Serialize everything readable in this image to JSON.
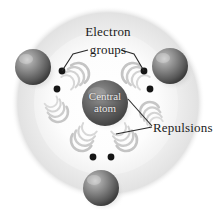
{
  "figure": {
    "background_color": "#ffffff",
    "width": 216,
    "height": 210
  },
  "labels": {
    "electron": "Electron",
    "groups": "groups",
    "repulsions": "Repulsions",
    "central_line1": "Central",
    "central_line2": "atom"
  },
  "colors": {
    "text": "#1b1b1b",
    "central_text": "#eceaea",
    "sphere_dark": "#3f3f3f",
    "sphere_mid": "#767676",
    "sphere_light": "#b9b9b9",
    "halo": "#e9e9e9",
    "dot": "#161616",
    "leader": "#2a2a2a",
    "arc": "#c9c9c9"
  },
  "diagram": {
    "halo": {
      "cx": 108,
      "cy": 103,
      "r": 97
    },
    "central_atom": {
      "cx": 105,
      "cy": 103,
      "r": 23,
      "label": "Central atom"
    },
    "outer_spheres": [
      {
        "name": "sphere-left",
        "cx": 33,
        "cy": 67,
        "r": 18
      },
      {
        "name": "sphere-right",
        "cx": 170,
        "cy": 66,
        "r": 18
      },
      {
        "name": "sphere-bottom",
        "cx": 101,
        "cy": 188,
        "r": 18
      }
    ],
    "electron_dots": [
      {
        "name": "dot-upper-left",
        "cx": 62,
        "cy": 71
      },
      {
        "name": "dot-mid-left",
        "cx": 57,
        "cy": 89
      },
      {
        "name": "dot-upper-right",
        "cx": 144,
        "cy": 71
      },
      {
        "name": "dot-mid-right",
        "cx": 150,
        "cy": 89
      },
      {
        "name": "dot-bottom-left",
        "cx": 93,
        "cy": 157
      },
      {
        "name": "dot-bottom-right",
        "cx": 111,
        "cy": 157
      }
    ],
    "repulsion_arc_groups": [
      {
        "name": "arc-top-left",
        "cx": 78,
        "cy": 74,
        "rotate": -35
      },
      {
        "name": "arc-top-right",
        "cx": 131,
        "cy": 74,
        "rotate": 215
      },
      {
        "name": "arc-left",
        "cx": 56,
        "cy": 112,
        "rotate": 60
      },
      {
        "name": "arc-bottom-left",
        "cx": 80,
        "cy": 140,
        "rotate": 125
      },
      {
        "name": "arc-bottom-right",
        "cx": 126,
        "cy": 140,
        "rotate": 55
      },
      {
        "name": "arc-right",
        "cx": 150,
        "cy": 112,
        "rotate": 240
      }
    ],
    "leader_lines": [
      {
        "name": "leader-electron-groups-left",
        "points": "62,71 73,54 89,50"
      },
      {
        "name": "leader-electron-groups-right",
        "points": "144,71 134,54 122,50"
      },
      {
        "name": "leader-repulsions-upper",
        "points": "128,99 152,126"
      },
      {
        "name": "leader-repulsions-lower",
        "points": "116,133 152,127"
      }
    ]
  }
}
